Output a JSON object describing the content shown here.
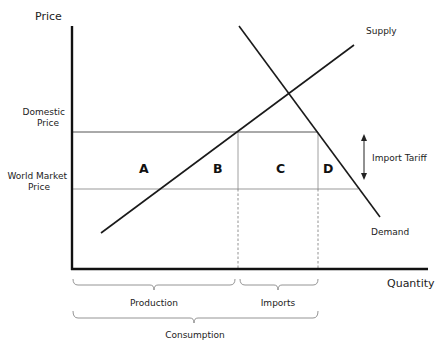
{
  "diagram": {
    "y_axis_label": "Price",
    "x_axis_label": "Quantity",
    "price_levels": {
      "domestic": {
        "line1": "Domestic",
        "line2": "Price"
      },
      "world": {
        "line1": "World Market",
        "line2": "Price"
      }
    },
    "curves": {
      "supply": "Supply",
      "demand": "Demand"
    },
    "regions": [
      "A",
      "B",
      "C",
      "D"
    ],
    "tariff_label": "Import Tariff",
    "braces": {
      "production": "Production",
      "imports": "Imports",
      "consumption": "Consumption"
    },
    "colors": {
      "axis": "#111111",
      "curve": "#1a1a1a",
      "domestic_line": "#555555",
      "world_line": "#999999",
      "guide": "#777777"
    }
  }
}
